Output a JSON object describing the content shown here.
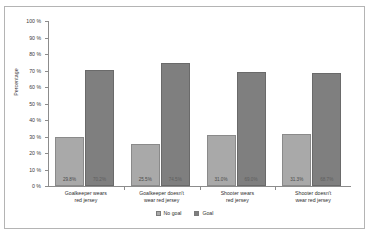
{
  "chart_data": {
    "type": "bar",
    "title": "",
    "xlabel": "",
    "ylabel": "Percentage",
    "ylim": [
      0,
      100
    ],
    "grid": false,
    "legend_position": "bottom-center",
    "categories": [
      "Goalkeeper wears red jersey",
      "Goalkeeper doesn't wear red jersey",
      "Shooter wears red jersey",
      "Shooter doesn't wear red jersey"
    ],
    "category_lines": [
      [
        "Goalkeeper wears",
        "red jersey"
      ],
      [
        "Goalkeeper doesn't",
        "wear red jersey"
      ],
      [
        "Shooter wears",
        "red jersey"
      ],
      [
        "Shooter doesn't",
        "wear red jersey"
      ]
    ],
    "series": [
      {
        "name": "No goal",
        "color": "#a9a9a9",
        "values": [
          29.8,
          25.5,
          31.0,
          31.3
        ],
        "labels": [
          "29.8%",
          "25.5%",
          "31.0%",
          "31.3%"
        ]
      },
      {
        "name": "Goal",
        "color": "#7f7f7f",
        "values": [
          70.2,
          74.5,
          69.0,
          68.7
        ],
        "labels": [
          "70.2%",
          "74.5%",
          "69.0%",
          "68.7%"
        ]
      }
    ],
    "y_ticks": [
      "0 %",
      "10 %",
      "20 %",
      "30 %",
      "40 %",
      "50 %",
      "60 %",
      "70 %",
      "80 %",
      "90 %",
      "100 %"
    ],
    "y_tick_values": [
      0,
      10,
      20,
      30,
      40,
      50,
      60,
      70,
      80,
      90,
      100
    ]
  }
}
